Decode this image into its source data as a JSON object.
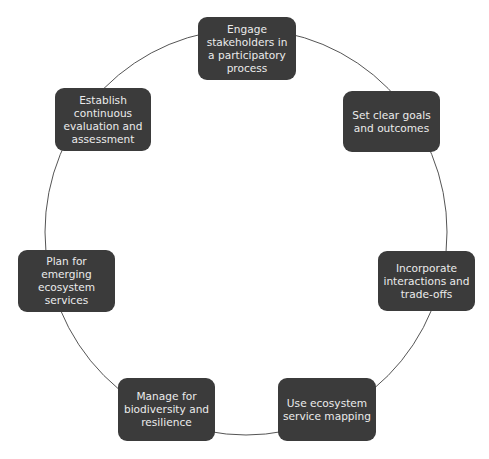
{
  "diagram": {
    "type": "cycle",
    "nodes": [
      {
        "label": "Engage stakeholders in a participatory process"
      },
      {
        "label": "Set clear goals and outcomes"
      },
      {
        "label": "Incorporate interactions and trade-offs"
      },
      {
        "label": "Use ecosystem service mapping"
      },
      {
        "label": "Manage for biodiversity and resilience"
      },
      {
        "label": "Plan for emerging ecosystem services"
      },
      {
        "label": "Establish continuous evaluation and assessment"
      }
    ],
    "colors": {
      "node_fill": "#3b3b3b",
      "node_text": "#ebebeb",
      "ring": "#555555"
    }
  }
}
